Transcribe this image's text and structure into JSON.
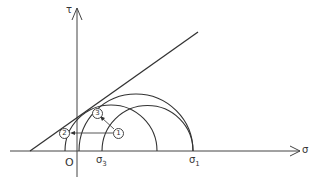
{
  "diagram": {
    "type": "mohr-circle",
    "axes": {
      "x_label": "σ",
      "y_label": "τ",
      "origin_label": "O"
    },
    "ticks": {
      "sigma3": {
        "base": "σ",
        "sub": "3"
      },
      "sigma1": {
        "base": "σ",
        "sub": "1"
      }
    },
    "points": [
      {
        "id": "1",
        "label": "1"
      },
      {
        "id": "2",
        "label": "2"
      },
      {
        "id": "3",
        "label": "3"
      }
    ],
    "colors": {
      "line": "#333333",
      "background": "#ffffff"
    }
  }
}
